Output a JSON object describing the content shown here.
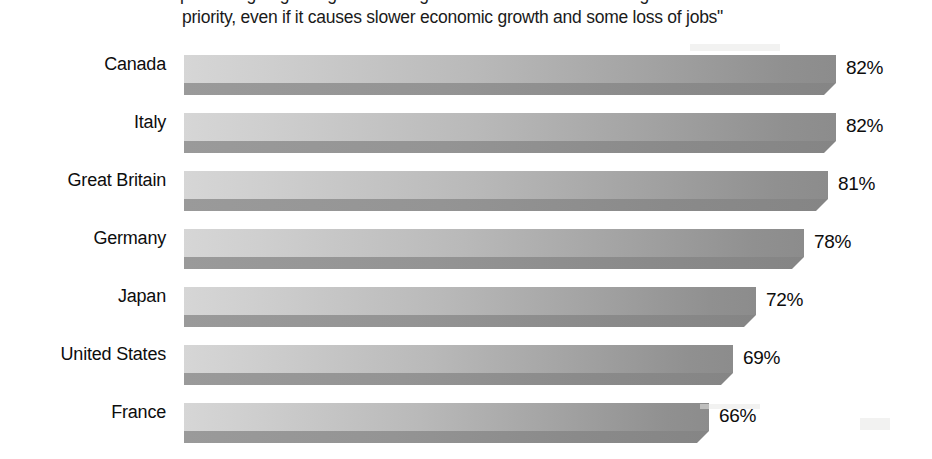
{
  "title": {
    "line1": "percentage agreeing: \"Protecting the environment should be given",
    "line2": "priority,  even if it causes slower economic growth and some loss of jobs\""
  },
  "chart_data": {
    "type": "bar",
    "orientation": "horizontal",
    "title": "percentage agreeing: \"Protecting the environment should be given priority,  even if it causes slower economic growth and some loss of jobs\"",
    "xlabel": "",
    "ylabel": "",
    "xlim": [
      0,
      100
    ],
    "grid": false,
    "legend": false,
    "value_suffix": "%",
    "categories": [
      "Canada",
      "Italy",
      "Great Britain",
      "Germany",
      "Japan",
      "United States",
      "France"
    ],
    "values": [
      82,
      82,
      81,
      78,
      72,
      69,
      66
    ],
    "value_labels": [
      "82%",
      "82%",
      "81%",
      "78%",
      "72%",
      "69%",
      "66%"
    ],
    "colors": {
      "bar_light": "#d6d6d6",
      "bar_dark": "#8c8c8c",
      "bar_side": "#909090",
      "text": "#0d0d0d",
      "background": "#ffffff"
    }
  }
}
